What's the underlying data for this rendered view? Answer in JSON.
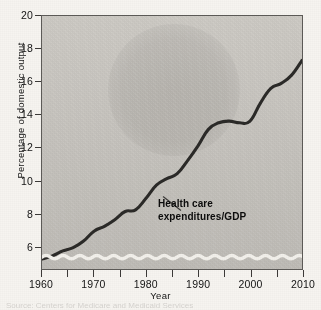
{
  "chart_data": {
    "type": "line",
    "title": "",
    "xlabel": "Year",
    "ylabel": "Percentage of domestic output",
    "xlim": [
      1960,
      2010
    ],
    "ylim": [
      4.6,
      20
    ],
    "grid": false,
    "legend": "none",
    "axis_break": true,
    "axis_break_note": "white wavy break line near bottom of plot indicating truncated y-axis",
    "y_ticks": [
      6,
      8,
      10,
      12,
      14,
      16,
      18,
      20
    ],
    "y_tick_labels": [
      "6",
      "8",
      "10",
      "12",
      "14",
      "16",
      "18",
      "20"
    ],
    "x_ticks": [
      1960,
      1965,
      1970,
      1975,
      1980,
      1985,
      1990,
      1995,
      2000,
      2005,
      2010
    ],
    "x_tick_labels": [
      "1960",
      "",
      "1970",
      "",
      "1980",
      "",
      "1990",
      "",
      "2000",
      "",
      "2010"
    ],
    "annotations": [
      {
        "text_line_1": "Health care",
        "text_line_2": "expenditures/GDP",
        "leader_line": true
      }
    ],
    "series": [
      {
        "name": "Health care expenditures/GDP",
        "color": "#2b2a28",
        "x": [
          1960,
          1962,
          1964,
          1966,
          1968,
          1970,
          1972,
          1974,
          1976,
          1978,
          1980,
          1982,
          1984,
          1986,
          1988,
          1990,
          1992,
          1994,
          1996,
          1998,
          2000,
          2002,
          2004,
          2006,
          2008,
          2010
        ],
        "values": [
          5.2,
          5.4,
          5.7,
          5.9,
          6.3,
          6.9,
          7.2,
          7.6,
          8.1,
          8.2,
          8.9,
          9.7,
          10.1,
          10.4,
          11.2,
          12.1,
          13.1,
          13.5,
          13.6,
          13.5,
          13.6,
          14.7,
          15.6,
          15.9,
          16.4,
          17.3
        ]
      }
    ]
  },
  "axes": {
    "y_label": "Percentage of domestic output",
    "x_label": "Year"
  },
  "annotation": {
    "line1": "Health care",
    "line2": "expenditures/GDP"
  },
  "source": {
    "text": "Source: Centers for Medicare and Medicaid Services"
  }
}
